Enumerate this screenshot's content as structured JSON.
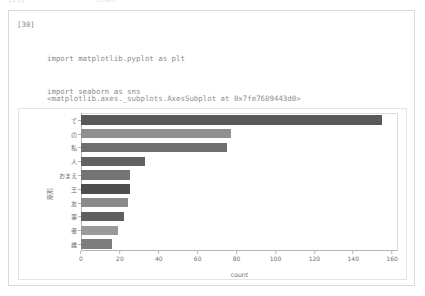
{
  "ghost": {
    "left_fragment": "[29]",
    "right_fragment": "count"
  },
  "cell": {
    "execution_count_label": "[30]",
    "code_lines": [
      "import matplotlib.pyplot as plt",
      "import seaborn as sns",
      "import japanize_matplotlib",
      "plt.figure(figsize=(10, 5))",
      "sns.barplot(x=count['count'], y=count['原形'])"
    ],
    "output_text": "<matplotlib.axes._subplots.AxesSubplot at 0x7fe7689443d0>"
  },
  "chart_data": {
    "type": "bar",
    "orientation": "horizontal",
    "title": "",
    "xlabel": "count",
    "ylabel": "原形",
    "categories": [
      "て",
      "の",
      "私",
      "人",
      "おまえ",
      "王",
      "友",
      "事",
      "者",
      "誰"
    ],
    "values": [
      155,
      77,
      75,
      33,
      25,
      25,
      24,
      22,
      19,
      16
    ],
    "xlim": [
      0,
      163
    ],
    "xticks": [
      0,
      20,
      40,
      60,
      80,
      100,
      120,
      140,
      160
    ],
    "grid": false,
    "legend": false,
    "bar_colors": [
      "#595959",
      "#8f8f8f",
      "#6e6e6e",
      "#626262",
      "#747474",
      "#4e4e4e",
      "#8a8a8a",
      "#5f5f5f",
      "#9a9a9a",
      "#7d7d7d"
    ]
  },
  "colors": {
    "cell_border": "#d9d9d9",
    "figure_border": "#e4e4e4",
    "code_text": "#8a8a8a",
    "axis": "#b4b4b4",
    "tick_text": "#6f6f6f"
  }
}
